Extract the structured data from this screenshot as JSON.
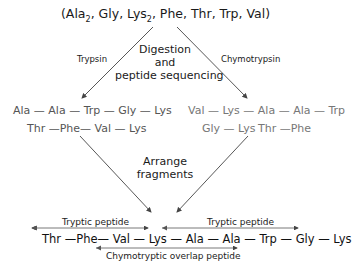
{
  "composition": {
    "prefix": "(Ala",
    "sub1": "2",
    "mid1": ", Gly, Lys",
    "sub2": "2",
    "rest": ", Phe, Thr, Trp, Val)"
  },
  "enzymes": {
    "left": "Trypsin",
    "right": "Chymotrypsin"
  },
  "step1": {
    "line1": "Digestion",
    "line2": "and",
    "line3": "peptide sequencing"
  },
  "trypsin_fragments": [
    "Ala — Ala — Trp — Gly — Lys",
    "Thr —Phe— Val — Lys"
  ],
  "chymotrypsin_fragments": [
    "Val — Lys — Ala — Ala — Trp",
    "Gly — Lys",
    "Thr —Phe"
  ],
  "step2": {
    "line1": "Arrange",
    "line2": "fragments"
  },
  "result": {
    "tryptic_left": "Tryptic peptide",
    "tryptic_right": "Tryptic peptide",
    "sequence": "Thr —Phe— Val — Lys — Ala — Ala — Trp — Gly — Lys",
    "overlap": "Chymotryptic overlap peptide"
  },
  "colors": {
    "text": "#1a1a1a",
    "fragment_text": "#666666",
    "lines": "#444444"
  }
}
